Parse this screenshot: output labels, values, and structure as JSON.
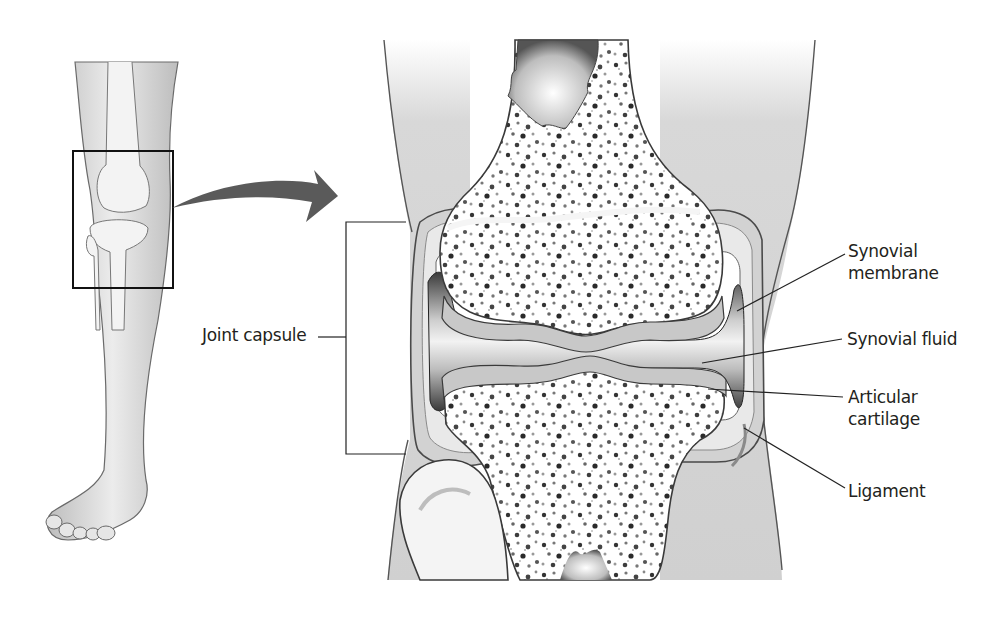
{
  "figure": {
    "overview_view": "Lower leg with knee region highlighted",
    "detail_view": "Cross-section of knee joint"
  },
  "labels": {
    "synovial_membrane": "Synovial membrane",
    "synovial_fluid": "Synovial fluid",
    "articular_cartilage": "Articular cartilage",
    "ligament": "Ligament",
    "joint_capsule": "Joint capsule"
  },
  "colors": {
    "skin": "#d9d9d9",
    "bone": "#ffffff",
    "cartilage": "#cfcfcf",
    "outline": "#3a3a3a",
    "arrow": "#5a5a5a",
    "text": "#231f20"
  }
}
